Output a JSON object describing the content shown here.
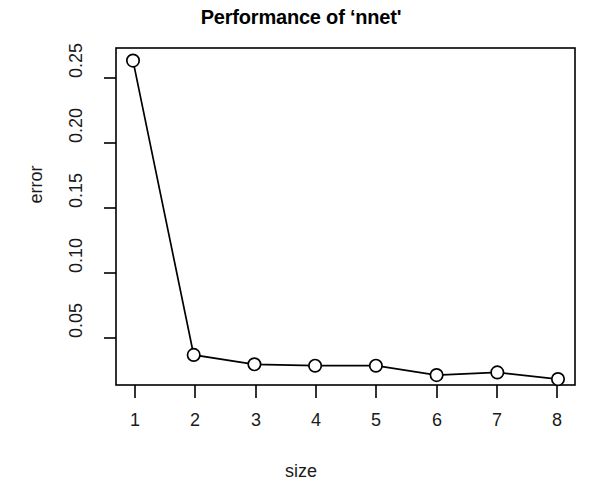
{
  "chart_data": {
    "type": "line",
    "title": "Performance of ‘nnet'",
    "xlabel": "size",
    "ylabel": "error",
    "x": [
      1,
      2,
      3,
      4,
      5,
      6,
      7,
      8
    ],
    "values": [
      0.261,
      0.042,
      0.035,
      0.034,
      0.034,
      0.027,
      0.029,
      0.024
    ],
    "series": [
      {
        "name": "error",
        "values": [
          0.261,
          0.042,
          0.035,
          0.034,
          0.034,
          0.027,
          0.029,
          0.024
        ]
      }
    ],
    "xtick_labels": [
      "1",
      "2",
      "3",
      "4",
      "5",
      "6",
      "7",
      "8"
    ],
    "xticks": [
      1,
      2,
      3,
      4,
      5,
      6,
      7,
      8
    ],
    "ytick_labels": [
      "0.05",
      "0.10",
      "0.15",
      "0.20",
      "0.25"
    ],
    "yticks": [
      0.05,
      0.1,
      0.15,
      0.2,
      0.25
    ],
    "xlim": [
      0.72,
      8.28
    ],
    "ylim": [
      0.0196,
      0.2704
    ],
    "grid": false,
    "legend": "none",
    "marker": "open-circle",
    "line_color": "#000000",
    "marker_color": "#000000",
    "background_color": "#ffffff",
    "box_border": true
  }
}
